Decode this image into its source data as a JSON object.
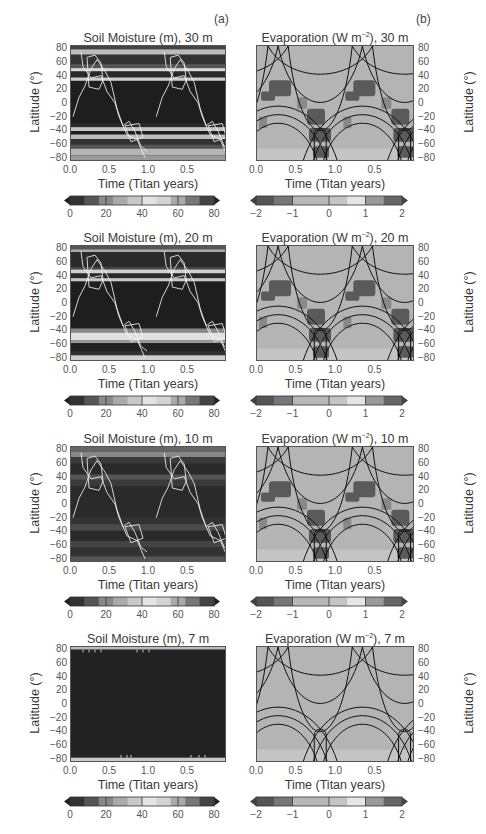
{
  "figure": {
    "panel_labels": {
      "a": "(a)",
      "b": "(b)"
    },
    "x_axis_label": "Time (Titan years)",
    "y_axis_label": "Latitude (°)",
    "x_ticks": [
      "0.0",
      "0.5",
      "1.0",
      "0.5"
    ],
    "y_ticks": [
      "80",
      "60",
      "40",
      "20",
      "0",
      "−20",
      "−40",
      "−60",
      "−80"
    ],
    "soil_colorbar_ticks": [
      "0",
      "20",
      "40",
      "60",
      "80"
    ],
    "evap_colorbar_ticks": [
      "−2",
      "−1",
      "0",
      "1",
      "2"
    ],
    "rows": [
      {
        "soil_title": "Soil Moisture (m), 30 m",
        "evap_title_main": "Evaporation (W m",
        "evap_title_sup": "−2",
        "evap_title_end": "), 30 m"
      },
      {
        "soil_title": "Soil Moisture (m), 20 m",
        "evap_title_main": "Evaporation (W m",
        "evap_title_sup": "−2",
        "evap_title_end": "), 20 m"
      },
      {
        "soil_title": "Soil Moisture (m), 10 m",
        "evap_title_main": "Evaporation (W m",
        "evap_title_sup": "−2",
        "evap_title_end": "), 10 m"
      },
      {
        "soil_title": "Soil Moisture (m), 7 m",
        "evap_title_main": "Evaporation (W m",
        "evap_title_sup": "−2",
        "evap_title_end": "), 7 m"
      }
    ]
  },
  "chart_data": [
    {
      "type": "heatmap",
      "title": "Soil Moisture (m), 30 m",
      "xlabel": "Time (Titan years)",
      "ylabel": "Latitude (°)",
      "x_ticks": [
        "0.0",
        "0.5",
        "1.0",
        "0.5"
      ],
      "ylim": [
        -85,
        85
      ],
      "y_ticks": [
        80,
        60,
        40,
        20,
        0,
        -20,
        -40,
        -60,
        -80
      ],
      "colorbar": {
        "range": [
          0,
          80
        ],
        "ticks": [
          0,
          20,
          40,
          60,
          80
        ],
        "colormap": "grayscale"
      },
      "overlay": "white contour lines (evaporation)",
      "description": "Latitudinal bands of soil moisture; bright bands near 80, 50, 35, −35, −50, −70, −80"
    },
    {
      "type": "heatmap",
      "title": "Evaporation (W m−2), 30 m",
      "xlabel": "Time (Titan years)",
      "ylabel": "Latitude (°)",
      "x_ticks": [
        "0.0",
        "0.5",
        "1.0",
        "0.5"
      ],
      "ylim": [
        -85,
        85
      ],
      "y_ticks": [
        80,
        60,
        40,
        20,
        0,
        -20,
        -40,
        -60,
        -80
      ],
      "colorbar": {
        "range": [
          -2,
          2
        ],
        "ticks": [
          -2,
          -1,
          0,
          1,
          2
        ],
        "colormap": "grayscale diverging"
      },
      "overlay": "black contour lines (seasonal insolation)"
    },
    {
      "type": "heatmap",
      "title": "Soil Moisture (m), 20 m",
      "xlabel": "Time (Titan years)",
      "ylabel": "Latitude (°)",
      "x_ticks": [
        "0.0",
        "0.5",
        "1.0",
        "0.5"
      ],
      "ylim": [
        -85,
        85
      ],
      "y_ticks": [
        80,
        60,
        40,
        20,
        0,
        -20,
        -40,
        -60,
        -80
      ],
      "colorbar": {
        "range": [
          0,
          80
        ],
        "ticks": [
          0,
          20,
          40,
          60,
          80
        ]
      }
    },
    {
      "type": "heatmap",
      "title": "Evaporation (W m−2), 20 m",
      "xlabel": "Time (Titan years)",
      "ylabel": "Latitude (°)",
      "x_ticks": [
        "0.0",
        "0.5",
        "1.0",
        "0.5"
      ],
      "ylim": [
        -85,
        85
      ],
      "y_ticks": [
        80,
        60,
        40,
        20,
        0,
        -20,
        -40,
        -60,
        -80
      ],
      "colorbar": {
        "range": [
          -2,
          2
        ],
        "ticks": [
          -2,
          -1,
          0,
          1,
          2
        ]
      }
    },
    {
      "type": "heatmap",
      "title": "Soil Moisture (m), 10 m",
      "xlabel": "Time (Titan years)",
      "ylabel": "Latitude (°)",
      "x_ticks": [
        "0.0",
        "0.5",
        "1.0",
        "0.5"
      ],
      "ylim": [
        -85,
        85
      ],
      "y_ticks": [
        80,
        60,
        40,
        20,
        0,
        -20,
        -40,
        -60,
        -80
      ],
      "colorbar": {
        "range": [
          0,
          80
        ],
        "ticks": [
          0,
          20,
          40,
          60,
          80
        ]
      }
    },
    {
      "type": "heatmap",
      "title": "Evaporation (W m−2), 10 m",
      "xlabel": "Time (Titan years)",
      "ylabel": "Latitude (°)",
      "x_ticks": [
        "0.0",
        "0.5",
        "1.0",
        "0.5"
      ],
      "ylim": [
        -85,
        85
      ],
      "y_ticks": [
        80,
        60,
        40,
        20,
        0,
        -20,
        -40,
        -60,
        -80
      ],
      "colorbar": {
        "range": [
          -2,
          2
        ],
        "ticks": [
          -2,
          -1,
          0,
          1,
          2
        ]
      }
    },
    {
      "type": "heatmap",
      "title": "Soil Moisture (m), 7 m",
      "xlabel": "Time (Titan years)",
      "ylabel": "Latitude (°)",
      "x_ticks": [
        "0.0",
        "0.5",
        "1.0",
        "0.5"
      ],
      "ylim": [
        -85,
        85
      ],
      "y_ticks": [
        80,
        60,
        40,
        20,
        0,
        -20,
        -40,
        -60,
        -80
      ],
      "colorbar": {
        "range": [
          0,
          80
        ],
        "ticks": [
          0,
          20,
          40,
          60,
          80
        ]
      },
      "description": "Nearly uniform dark (dry) field; small moist bands only at ±85"
    },
    {
      "type": "heatmap",
      "title": "Evaporation (W m−2), 7 m",
      "xlabel": "Time (Titan years)",
      "ylabel": "Latitude (°)",
      "x_ticks": [
        "0.0",
        "0.5",
        "1.0",
        "0.5"
      ],
      "ylim": [
        -85,
        85
      ],
      "y_ticks": [
        80,
        60,
        40,
        20,
        0,
        -20,
        -40,
        -60,
        -80
      ],
      "colorbar": {
        "range": [
          -2,
          2
        ],
        "ticks": [
          -2,
          -1,
          0,
          1,
          2
        ]
      },
      "description": "Nearly uniform ~0 evaporation with black insolation contours"
    }
  ]
}
